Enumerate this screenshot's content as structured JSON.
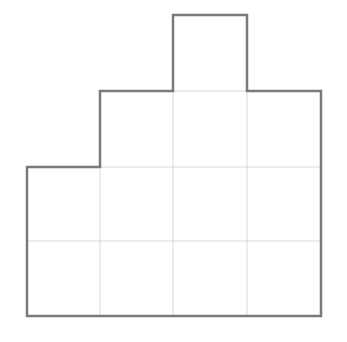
{
  "diagram": {
    "title": "",
    "grid": {
      "origin_x": 27,
      "origin_y": 15,
      "column_edges": [
        27,
        100,
        173,
        247,
        321
      ],
      "row_edges": [
        15,
        91,
        167,
        241,
        316
      ]
    },
    "columns": [
      {
        "index": 0,
        "height_cells": 2
      },
      {
        "index": 1,
        "height_cells": 3
      },
      {
        "index": 2,
        "height_cells": 4
      },
      {
        "index": 3,
        "height_cells": 3
      }
    ],
    "total_cells": 12,
    "colors": {
      "outline": "#7a7a7a",
      "grid_line": "#cfcfcf",
      "fill": "#ffffff",
      "background": "#ffffff"
    },
    "stroke": {
      "outline_width": 2.5,
      "grid_width": 0.8
    }
  }
}
